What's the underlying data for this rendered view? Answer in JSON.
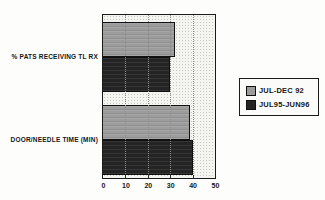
{
  "chart_data": {
    "type": "bar",
    "orientation": "horizontal",
    "title": "",
    "xlabel": "",
    "ylabel": "",
    "categories": [
      "% PATS RECEIVING TL RX",
      "DOOR/NEEDLE TIME (MIN)"
    ],
    "series": [
      {
        "name": "JUL-DEC 92",
        "color": "#9c9c9c",
        "values": [
          32,
          39
        ]
      },
      {
        "name": "JUL95-JUN96",
        "color": "#242424",
        "values": [
          30,
          40
        ]
      }
    ],
    "xlim": [
      0,
      50
    ],
    "xticks": [
      "0",
      "10",
      "20",
      "30",
      "40",
      "50"
    ],
    "grid": "dotted-vertical",
    "legend_position": "right-outside",
    "plot_background": "stippled-halftone"
  },
  "colors": {
    "series_light": "#9c9c9c",
    "series_dark": "#242424",
    "plot_background": "#f4f4f1",
    "frame": "#1a1a1a",
    "page_background": "#fdfdfc"
  }
}
